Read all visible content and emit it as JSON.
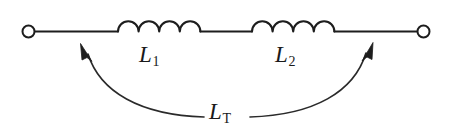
{
  "diagram": {
    "type": "schematic",
    "background_color": "#ffffff",
    "line_color": "#1d1d1d",
    "labels": {
      "inductor1": {
        "symbol": "L",
        "subscript": "1"
      },
      "inductor2": {
        "symbol": "L",
        "subscript": "2"
      },
      "total": {
        "symbol": "L",
        "subscript": "T"
      }
    },
    "components": [
      {
        "name": "terminal-left",
        "kind": "open-terminal",
        "cx": 28,
        "cy": 32
      },
      {
        "name": "inductor-1",
        "kind": "inductor",
        "coils": 4,
        "x_start": 118,
        "x_end": 200
      },
      {
        "name": "inductor-2",
        "kind": "inductor",
        "coils": 4,
        "x_start": 252,
        "x_end": 334
      },
      {
        "name": "terminal-right",
        "kind": "open-terminal",
        "cx": 424,
        "cy": 32
      }
    ],
    "annotation_arrow": {
      "name": "total-inductance-span",
      "style": "double-headed-curved",
      "from_x": 82,
      "to_x": 372,
      "apex_y": 116
    }
  }
}
